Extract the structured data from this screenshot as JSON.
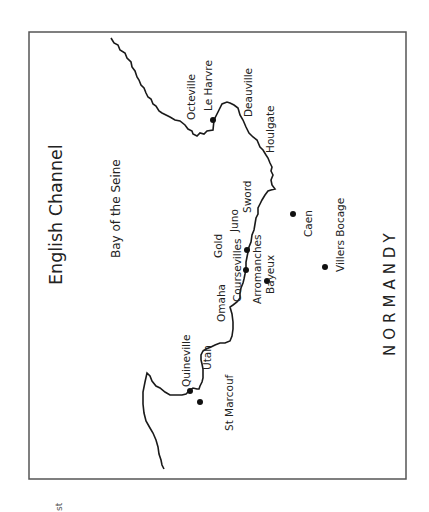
{
  "map": {
    "title": "English Channel",
    "subtitle": "Bay of the Seine",
    "region": "NORMANDY",
    "corner_fragment": "st",
    "colors": {
      "frame": "#555555",
      "coast": "#1a1a1a",
      "dot": "#111111",
      "text": "#222222"
    },
    "beaches": [
      {
        "name": "Utah"
      },
      {
        "name": "Omaha"
      },
      {
        "name": "Gold"
      },
      {
        "name": "Juno"
      },
      {
        "name": "Sword"
      }
    ],
    "towns": [
      {
        "name": "Octeville"
      },
      {
        "name": "Le Harvre",
        "dot": [
          213,
          120
        ]
      },
      {
        "name": "Deauville"
      },
      {
        "name": "Houlgate"
      },
      {
        "name": "Quineville",
        "dot": [
          190,
          391
        ]
      },
      {
        "name": "St Marcouf",
        "dot": [
          200,
          402
        ]
      },
      {
        "name": "Coursevilles",
        "dot": [
          246,
          270
        ]
      },
      {
        "name": "Arromanches",
        "dot": [
          247,
          250
        ]
      },
      {
        "name": "Bayeux",
        "dot": [
          267,
          281
        ]
      },
      {
        "name": "Caen",
        "dot": [
          293,
          214
        ]
      },
      {
        "name": "Villers Bocage",
        "dot": [
          325,
          267
        ]
      }
    ]
  }
}
